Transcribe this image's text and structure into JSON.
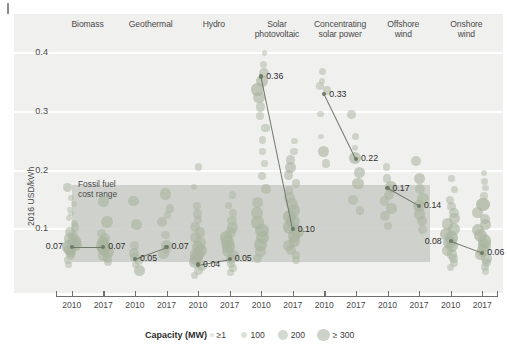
{
  "figure": {
    "ylabel": "2016 USD/kWh",
    "fossil_note_line1": "Fossil fuel",
    "fossil_note_line2": "cost range"
  },
  "legend": {
    "title": "Capacity (MW)",
    "items": [
      {
        "label": "≥1",
        "r": 1.6
      },
      {
        "label": "100",
        "r": 3.4
      },
      {
        "label": "200",
        "r": 4.8
      },
      {
        "label": "≥ 300",
        "r": 6.4
      }
    ]
  },
  "chart_data": {
    "type": "scatter",
    "title": "",
    "xlabel": "",
    "ylabel": "2016 USD/kWh",
    "ylim": [
      0.0,
      0.42
    ],
    "yticks": [
      0.1,
      0.2,
      0.3,
      0.4
    ],
    "ytick_labels": [
      "0.1",
      "0.2",
      "0.3",
      "0.4"
    ],
    "grid": true,
    "legend_position": "bottom",
    "size_encoding": "Capacity (MW)",
    "fossil_fuel_band": {
      "label": "Fossil fuel cost range",
      "low": 0.045,
      "high": 0.175
    },
    "x_tick_labels": [
      "2010",
      "2017",
      "2010",
      "2017",
      "2010",
      "2017",
      "2010",
      "2017",
      "2010",
      "2017",
      "2010",
      "2017",
      "2010",
      "2017"
    ],
    "categories": [
      {
        "name": "Biomass",
        "label_lines": [
          "Biomass"
        ],
        "years": [
          2010,
          2017
        ],
        "weighted_average": [
          0.07,
          0.07
        ],
        "value_labels": [
          "0.07",
          "0.07"
        ],
        "points_2010": [
          {
            "y": 0.171,
            "mw": 120
          },
          {
            "y": 0.153,
            "mw": 40
          },
          {
            "y": 0.143,
            "mw": 30
          },
          {
            "y": 0.134,
            "mw": 25
          },
          {
            "y": 0.127,
            "mw": 30
          },
          {
            "y": 0.119,
            "mw": 40
          },
          {
            "y": 0.11,
            "mw": 60
          },
          {
            "y": 0.103,
            "mw": 90
          },
          {
            "y": 0.096,
            "mw": 150
          },
          {
            "y": 0.09,
            "mw": 120
          },
          {
            "y": 0.084,
            "mw": 200
          },
          {
            "y": 0.079,
            "mw": 260
          },
          {
            "y": 0.074,
            "mw": 300
          },
          {
            "y": 0.07,
            "mw": 320
          },
          {
            "y": 0.065,
            "mw": 240
          },
          {
            "y": 0.06,
            "mw": 160
          },
          {
            "y": 0.055,
            "mw": 110
          },
          {
            "y": 0.048,
            "mw": 70
          },
          {
            "y": 0.04,
            "mw": 40
          }
        ],
        "points_2017": [
          {
            "y": 0.148,
            "mw": 190
          },
          {
            "y": 0.112,
            "mw": 220
          },
          {
            "y": 0.093,
            "mw": 130
          },
          {
            "y": 0.085,
            "mw": 160
          },
          {
            "y": 0.078,
            "mw": 240
          },
          {
            "y": 0.072,
            "mw": 320
          },
          {
            "y": 0.067,
            "mw": 300
          },
          {
            "y": 0.062,
            "mw": 250
          },
          {
            "y": 0.056,
            "mw": 180
          },
          {
            "y": 0.05,
            "mw": 120
          },
          {
            "y": 0.044,
            "mw": 80
          }
        ]
      },
      {
        "name": "Geothermal",
        "label_lines": [
          "Geothermal"
        ],
        "years": [
          2010,
          2017
        ],
        "weighted_average": [
          0.05,
          0.07
        ],
        "value_labels": [
          "0.05",
          "0.07"
        ],
        "points_2010": [
          {
            "y": 0.148,
            "mw": 180
          },
          {
            "y": 0.108,
            "mw": 200
          },
          {
            "y": 0.072,
            "mw": 110
          },
          {
            "y": 0.06,
            "mw": 150
          },
          {
            "y": 0.052,
            "mw": 130
          },
          {
            "y": 0.046,
            "mw": 90
          },
          {
            "y": 0.04,
            "mw": 60
          },
          {
            "y": 0.03,
            "mw": 180
          }
        ],
        "points_2017": [
          {
            "y": 0.16,
            "mw": 200
          },
          {
            "y": 0.135,
            "mw": 110
          },
          {
            "y": 0.124,
            "mw": 70
          },
          {
            "y": 0.113,
            "mw": 150
          },
          {
            "y": 0.09,
            "mw": 90
          },
          {
            "y": 0.073,
            "mw": 190
          },
          {
            "y": 0.066,
            "mw": 120
          },
          {
            "y": 0.058,
            "mw": 160
          }
        ]
      },
      {
        "name": "Hydro",
        "label_lines": [
          "Hydro"
        ],
        "years": [
          2010,
          2017
        ],
        "weighted_average": [
          0.04,
          0.05
        ],
        "value_labels": [
          "0.04",
          "0.05"
        ],
        "points_2010": [
          {
            "y": 0.206,
            "mw": 60
          },
          {
            "y": 0.172,
            "mw": 40
          },
          {
            "y": 0.14,
            "mw": 80
          },
          {
            "y": 0.126,
            "mw": 120
          },
          {
            "y": 0.116,
            "mw": 90
          },
          {
            "y": 0.104,
            "mw": 140
          },
          {
            "y": 0.094,
            "mw": 180
          },
          {
            "y": 0.086,
            "mw": 160
          },
          {
            "y": 0.078,
            "mw": 200
          },
          {
            "y": 0.07,
            "mw": 240
          },
          {
            "y": 0.063,
            "mw": 280
          },
          {
            "y": 0.057,
            "mw": 320
          },
          {
            "y": 0.05,
            "mw": 260
          },
          {
            "y": 0.044,
            "mw": 200
          },
          {
            "y": 0.038,
            "mw": 150
          },
          {
            "y": 0.03,
            "mw": 100
          },
          {
            "y": 0.022,
            "mw": 60
          }
        ],
        "points_2017": [
          {
            "y": 0.158,
            "mw": 70
          },
          {
            "y": 0.14,
            "mw": 50
          },
          {
            "y": 0.128,
            "mw": 90
          },
          {
            "y": 0.115,
            "mw": 130
          },
          {
            "y": 0.103,
            "mw": 170
          },
          {
            "y": 0.094,
            "mw": 200
          },
          {
            "y": 0.086,
            "mw": 240
          },
          {
            "y": 0.078,
            "mw": 300
          },
          {
            "y": 0.07,
            "mw": 280
          },
          {
            "y": 0.063,
            "mw": 220
          },
          {
            "y": 0.056,
            "mw": 180
          },
          {
            "y": 0.049,
            "mw": 140
          },
          {
            "y": 0.042,
            "mw": 100
          },
          {
            "y": 0.034,
            "mw": 70
          },
          {
            "y": 0.026,
            "mw": 50
          }
        ]
      },
      {
        "name": "Solar photovoltaic",
        "label_lines": [
          "Solar",
          "photovoltaic"
        ],
        "years": [
          2010,
          2017
        ],
        "weighted_average": [
          0.36,
          0.1
        ],
        "value_labels": [
          "0.36",
          "0.10"
        ],
        "points_2010": [
          {
            "y": 0.4,
            "mw": 30
          },
          {
            "y": 0.38,
            "mw": 60
          },
          {
            "y": 0.366,
            "mw": 150
          },
          {
            "y": 0.352,
            "mw": 220
          },
          {
            "y": 0.338,
            "mw": 260
          },
          {
            "y": 0.324,
            "mw": 200
          },
          {
            "y": 0.308,
            "mw": 120
          },
          {
            "y": 0.292,
            "mw": 80
          },
          {
            "y": 0.272,
            "mw": 100
          },
          {
            "y": 0.252,
            "mw": 60
          },
          {
            "y": 0.232,
            "mw": 50
          },
          {
            "y": 0.212,
            "mw": 40
          },
          {
            "y": 0.19,
            "mw": 90
          },
          {
            "y": 0.168,
            "mw": 140
          },
          {
            "y": 0.146,
            "mw": 180
          },
          {
            "y": 0.128,
            "mw": 220
          },
          {
            "y": 0.112,
            "mw": 260
          },
          {
            "y": 0.098,
            "mw": 300
          },
          {
            "y": 0.086,
            "mw": 280
          },
          {
            "y": 0.074,
            "mw": 240
          },
          {
            "y": 0.062,
            "mw": 180
          },
          {
            "y": 0.05,
            "mw": 120
          }
        ],
        "points_2017": [
          {
            "y": 0.25,
            "mw": 40
          },
          {
            "y": 0.232,
            "mw": 60
          },
          {
            "y": 0.218,
            "mw": 120
          },
          {
            "y": 0.205,
            "mw": 180
          },
          {
            "y": 0.192,
            "mw": 140
          },
          {
            "y": 0.178,
            "mw": 90
          },
          {
            "y": 0.166,
            "mw": 110
          },
          {
            "y": 0.154,
            "mw": 160
          },
          {
            "y": 0.143,
            "mw": 200
          },
          {
            "y": 0.132,
            "mw": 240
          },
          {
            "y": 0.122,
            "mw": 280
          },
          {
            "y": 0.113,
            "mw": 300
          },
          {
            "y": 0.104,
            "mw": 320
          },
          {
            "y": 0.096,
            "mw": 300
          },
          {
            "y": 0.088,
            "mw": 260
          },
          {
            "y": 0.08,
            "mw": 220
          },
          {
            "y": 0.072,
            "mw": 180
          },
          {
            "y": 0.064,
            "mw": 140
          },
          {
            "y": 0.056,
            "mw": 100
          },
          {
            "y": 0.048,
            "mw": 70
          }
        ]
      },
      {
        "name": "Concentrating solar power",
        "label_lines": [
          "Concentrating",
          "solar power"
        ],
        "years": [
          2010,
          2017
        ],
        "weighted_average": [
          0.33,
          0.22
        ],
        "value_labels": [
          "0.33",
          "0.22"
        ],
        "points_2010": [
          {
            "y": 0.368,
            "mw": 60
          },
          {
            "y": 0.352,
            "mw": 40
          },
          {
            "y": 0.344,
            "mw": 70
          },
          {
            "y": 0.336,
            "mw": 90
          },
          {
            "y": 0.296,
            "mw": 50
          },
          {
            "y": 0.258,
            "mw": 30
          },
          {
            "y": 0.232,
            "mw": 200
          },
          {
            "y": 0.212,
            "mw": 90
          }
        ],
        "points_2017": [
          {
            "y": 0.296,
            "mw": 110
          },
          {
            "y": 0.258,
            "mw": 70
          },
          {
            "y": 0.238,
            "mw": 50
          },
          {
            "y": 0.222,
            "mw": 230
          },
          {
            "y": 0.196,
            "mw": 180
          },
          {
            "y": 0.178,
            "mw": 210
          },
          {
            "y": 0.15,
            "mw": 130
          },
          {
            "y": 0.132,
            "mw": 90
          }
        ]
      },
      {
        "name": "Offshore wind",
        "label_lines": [
          "Offshore",
          "wind"
        ],
        "years": [
          2010,
          2017
        ],
        "weighted_average": [
          0.17,
          0.14
        ],
        "value_labels": [
          "0.17",
          "0.14"
        ],
        "points_2010": [
          {
            "y": 0.206,
            "mw": 60
          },
          {
            "y": 0.186,
            "mw": 110
          },
          {
            "y": 0.172,
            "mw": 230
          },
          {
            "y": 0.158,
            "mw": 150
          },
          {
            "y": 0.148,
            "mw": 120
          },
          {
            "y": 0.136,
            "mw": 180
          },
          {
            "y": 0.122,
            "mw": 140
          },
          {
            "y": 0.106,
            "mw": 90
          }
        ],
        "points_2017": [
          {
            "y": 0.216,
            "mw": 130
          },
          {
            "y": 0.186,
            "mw": 180
          },
          {
            "y": 0.168,
            "mw": 160
          },
          {
            "y": 0.152,
            "mw": 200
          },
          {
            "y": 0.14,
            "mw": 240
          },
          {
            "y": 0.126,
            "mw": 190
          },
          {
            "y": 0.114,
            "mw": 150
          },
          {
            "y": 0.1,
            "mw": 110
          }
        ]
      },
      {
        "name": "Onshore wind",
        "label_lines": [
          "Onshore",
          "wind"
        ],
        "years": [
          2010,
          2017
        ],
        "weighted_average": [
          0.08,
          0.06
        ],
        "value_labels": [
          "0.08",
          "0.06"
        ],
        "points_2010": [
          {
            "y": 0.186,
            "mw": 50
          },
          {
            "y": 0.168,
            "mw": 70
          },
          {
            "y": 0.15,
            "mw": 90
          },
          {
            "y": 0.138,
            "mw": 110
          },
          {
            "y": 0.128,
            "mw": 140
          },
          {
            "y": 0.118,
            "mw": 170
          },
          {
            "y": 0.109,
            "mw": 200
          },
          {
            "y": 0.1,
            "mw": 230
          },
          {
            "y": 0.092,
            "mw": 260
          },
          {
            "y": 0.085,
            "mw": 300
          },
          {
            "y": 0.078,
            "mw": 280
          },
          {
            "y": 0.071,
            "mw": 240
          },
          {
            "y": 0.064,
            "mw": 200
          },
          {
            "y": 0.057,
            "mw": 160
          },
          {
            "y": 0.05,
            "mw": 120
          },
          {
            "y": 0.043,
            "mw": 90
          },
          {
            "y": 0.035,
            "mw": 60
          }
        ],
        "points_2017": [
          {
            "y": 0.196,
            "mw": 40
          },
          {
            "y": 0.182,
            "mw": 60
          },
          {
            "y": 0.17,
            "mw": 50
          },
          {
            "y": 0.156,
            "mw": 80
          },
          {
            "y": 0.142,
            "mw": 320
          },
          {
            "y": 0.128,
            "mw": 200
          },
          {
            "y": 0.118,
            "mw": 160
          },
          {
            "y": 0.108,
            "mw": 190
          },
          {
            "y": 0.098,
            "mw": 230
          },
          {
            "y": 0.089,
            "mw": 270
          },
          {
            "y": 0.08,
            "mw": 300
          },
          {
            "y": 0.072,
            "mw": 280
          },
          {
            "y": 0.064,
            "mw": 240
          },
          {
            "y": 0.057,
            "mw": 200
          },
          {
            "y": 0.05,
            "mw": 160
          },
          {
            "y": 0.043,
            "mw": 120
          },
          {
            "y": 0.036,
            "mw": 80
          },
          {
            "y": 0.028,
            "mw": 50
          }
        ]
      }
    ]
  },
  "colors": {
    "dot": "#aab5a0",
    "dot_dark": "#8e9a86",
    "band": "#c9ccc6",
    "plot_bg": "#f0f0ef",
    "grid": "#ffffff",
    "axis": "#6f6f6f",
    "text": "#3b3b3b"
  }
}
